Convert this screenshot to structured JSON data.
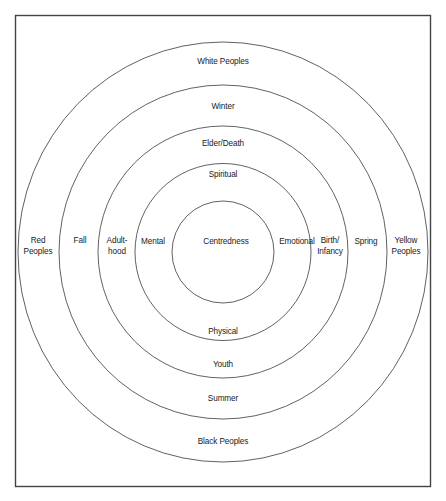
{
  "diagram": {
    "center_label": "Centredness",
    "rings": [
      {
        "name": "self",
        "top": "Spiritual",
        "bottom": "Physical",
        "left": [
          "Mental"
        ],
        "right": [
          "Emotional"
        ]
      },
      {
        "name": "life-stages",
        "top": "Elder/Death",
        "bottom": "Youth",
        "left": [
          "Adult-",
          "hood"
        ],
        "right": [
          "Birth/",
          "Infancy"
        ]
      },
      {
        "name": "seasons",
        "top": "Winter",
        "bottom": "Summer",
        "left": [
          "Fall"
        ],
        "right": [
          "Spring"
        ]
      },
      {
        "name": "peoples",
        "top": "White Peoples",
        "bottom": "Black Peoples",
        "left": [
          "Red",
          "Peoples"
        ],
        "right": [
          "Yellow",
          "Peoples"
        ]
      }
    ],
    "colors": {
      "line": "#3a3a3a",
      "text": "#1a1a1a",
      "background": "#ffffff"
    }
  }
}
